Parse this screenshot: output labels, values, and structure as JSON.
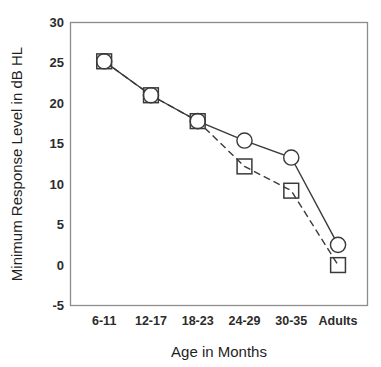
{
  "chart_data": {
    "type": "line",
    "title": "",
    "xlabel": "Age in Months",
    "ylabel": "Minimum Response Level in dB HL",
    "categories": [
      "6-11",
      "12-17",
      "18-23",
      "24-29",
      "30-35",
      "Adults"
    ],
    "series": [
      {
        "name": "circle-series",
        "marker": "open-circle",
        "line_style": "solid",
        "values": [
          25.2,
          21.0,
          17.8,
          15.4,
          13.3,
          2.5
        ]
      },
      {
        "name": "square-series",
        "marker": "open-square",
        "line_style": "dashed",
        "values": [
          25.2,
          21.0,
          17.8,
          12.2,
          9.2,
          0.0
        ]
      }
    ],
    "ylim": [
      -5,
      30
    ],
    "ytick_labels": [
      "30",
      "25",
      "20",
      "15",
      "10",
      "5",
      "0",
      "-5"
    ],
    "ytick_values": [
      30,
      25,
      20,
      15,
      10,
      5,
      0,
      -5
    ],
    "grid": false,
    "legend": "none",
    "colors": {
      "line": "#3a3a3a",
      "frame": "#8c8c8c",
      "background": "#ffffff",
      "text": "#1f1f1f"
    }
  },
  "axes": {
    "y_title": "Minimum Response Level in dB HL",
    "x_title": "Age in Months"
  }
}
